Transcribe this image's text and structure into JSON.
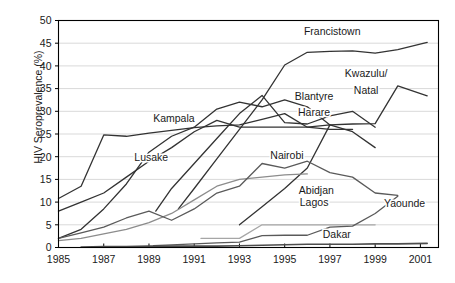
{
  "chart_data": {
    "type": "line",
    "title": "",
    "xlabel": "",
    "ylabel": "HIV Seroprevalence (%)",
    "xlim": [
      1985,
      2001.8
    ],
    "ylim": [
      0,
      50
    ],
    "ytick_step": 5,
    "xtick_step": 2,
    "grid": "horizontal",
    "legend": "inline-labels",
    "yticks": [
      "0",
      "5",
      "10",
      "15",
      "20",
      "25",
      "30",
      "35",
      "40",
      "45",
      "50"
    ],
    "xticks": [
      "1985",
      "1987",
      "1989",
      "1991",
      "1993",
      "1995",
      "1997",
      "1999",
      "2001"
    ],
    "series": [
      {
        "name": "Francistown",
        "color": "#333333",
        "width": 1.3,
        "label_x": 1997.1,
        "label_y": 47.6,
        "label_anchor": "middle",
        "x": [
          1990.3,
          1991.0,
          1992.0,
          1993.0,
          1994.0,
          1995.0,
          1996.0,
          1997.0,
          1998.0,
          1999.0,
          2000.0,
          2001.3
        ],
        "y": [
          8.5,
          13.0,
          19.5,
          26.0,
          32.5,
          40.2,
          43.0,
          43.2,
          43.3,
          42.8,
          43.6,
          45.2
        ]
      },
      {
        "name": "Kwazulu/Natal",
        "color": "#333333",
        "width": 1.3,
        "label_x": 1998.6,
        "label_y": 38.4,
        "label_anchor": "middle",
        "label_line2_y": 34.6,
        "x": [
          1993.0,
          1994.0,
          1995.0,
          1996.0,
          1997.0,
          1998.0,
          1999.0,
          2000.0,
          2001.3
        ],
        "y": [
          5.0,
          9.0,
          13.0,
          17.5,
          27.0,
          27.2,
          27.3,
          35.6,
          33.4
        ]
      },
      {
        "name": "Blantyre",
        "color": "#333333",
        "width": 1.3,
        "label_x": 1996.3,
        "label_y": 33.3,
        "label_anchor": "middle",
        "x": [
          1985.0,
          1986.0,
          1987.0,
          1988.0,
          1989.0,
          1990.0,
          1991.0,
          1992.0,
          1993.0,
          1994.0,
          1995.0,
          1996.0,
          1997.0
        ],
        "y": [
          2.0,
          4.0,
          8.5,
          14.0,
          21.0,
          24.5,
          26.5,
          30.5,
          32.0,
          31.0,
          32.5,
          31.0,
          27.0
        ]
      },
      {
        "name": "Harare",
        "color": "#333333",
        "width": 1.3,
        "label_x": 1996.3,
        "label_y": 29.7,
        "label_anchor": "middle",
        "x": [
          1989.3,
          1990.0,
          1991.0,
          1992.0,
          1993.0,
          1994.0,
          1995.0,
          1996.0,
          1997.0,
          1998.0,
          1999.0
        ],
        "y": [
          8.0,
          13.0,
          18.5,
          24.0,
          29.5,
          33.5,
          27.5,
          27.2,
          29.0,
          30.0,
          26.5
        ]
      },
      {
        "name": "Kampala",
        "color": "#333333",
        "width": 1.3,
        "label_x": 1990.1,
        "label_y": 28.5,
        "label_anchor": "middle",
        "x": [
          1985.0,
          1986.0,
          1987.0,
          1988.0,
          1989.0,
          1990.0,
          1991.0,
          1992.0,
          1993.0,
          1994.0,
          1995.0,
          1996.0,
          1997.0,
          1998.0
        ],
        "y": [
          10.8,
          13.5,
          24.8,
          24.5,
          25.2,
          25.8,
          26.4,
          26.8,
          27.0,
          28.2,
          29.5,
          26.5,
          26.0,
          26.0
        ]
      },
      {
        "name": "Lusake",
        "color": "#333333",
        "width": 1.3,
        "label_x": 1989.1,
        "label_y": 19.8,
        "label_anchor": "middle",
        "x": [
          1985.0,
          1986.0,
          1987.0,
          1988.0,
          1989.0,
          1990.0,
          1991.0,
          1992.0,
          1993.0,
          1994.0,
          1995.0,
          1996.0,
          1997.0,
          1998.0,
          1999.0
        ],
        "y": [
          8.0,
          10.0,
          12.0,
          15.5,
          19.0,
          22.0,
          25.5,
          28.0,
          26.5,
          26.5,
          26.5,
          26.5,
          27.0,
          25.5,
          22.0
        ]
      },
      {
        "name": "Nairobi",
        "color": "#8c8c8c",
        "width": 1.3,
        "label_x": 1995.1,
        "label_y": 20.4,
        "label_anchor": "middle",
        "x": [
          1985.0,
          1986.0,
          1987.0,
          1988.0,
          1989.0,
          1990.0,
          1991.0,
          1992.0,
          1993.0,
          1994.0,
          1995.0,
          1996.0
        ],
        "y": [
          1.5,
          2.0,
          3.0,
          4.0,
          5.5,
          7.5,
          10.5,
          13.5,
          15.0,
          15.5,
          16.0,
          16.2
        ]
      },
      {
        "name": "Abidjan",
        "color": "#5a5a5a",
        "width": 1.3,
        "label_x": 1996.4,
        "label_y": 12.6,
        "label_anchor": "middle",
        "x": [
          1985.0,
          1986.0,
          1987.0,
          1988.0,
          1989.0,
          1990.0,
          1991.0,
          1992.0,
          1993.0,
          1994.0,
          1995.0,
          1996.0,
          1997.0,
          1998.0,
          1999.0,
          2000.0
        ],
        "y": [
          2.0,
          3.2,
          4.5,
          6.5,
          8.0,
          6.0,
          8.5,
          12.0,
          13.5,
          18.5,
          17.5,
          19.0,
          16.5,
          15.5,
          12.0,
          11.5
        ]
      },
      {
        "name": "Lagos",
        "color": "#a6a6a6",
        "width": 1.3,
        "label_x": 1996.3,
        "label_y": 9.9,
        "label_anchor": "middle",
        "x": [
          1991.3,
          1992.0,
          1993.0,
          1994.0,
          1995.0,
          1996.0,
          1997.0,
          1998.0,
          1999.0
        ],
        "y": [
          2.0,
          2.0,
          2.0,
          5.0,
          5.0,
          5.0,
          5.0,
          5.0,
          5.0
        ]
      },
      {
        "name": "Yaounde",
        "color": "#5a5a5a",
        "width": 1.3,
        "label_x": 2000.3,
        "label_y": 9.7,
        "label_anchor": "middle",
        "x": [
          1989.2,
          1990.0,
          1991.0,
          1992.0,
          1993.0,
          1994.0,
          1995.0,
          1996.0,
          1997.0,
          1998.0,
          1999.0,
          2000.0
        ],
        "y": [
          0.4,
          0.6,
          0.8,
          1.0,
          1.2,
          2.6,
          2.7,
          2.7,
          4.5,
          4.7,
          7.5,
          11.3
        ]
      },
      {
        "name": "Dakar",
        "color": "#4d4d4d",
        "width": 1.6,
        "label_x": 1997.3,
        "label_y": 3.0,
        "label_anchor": "middle",
        "x": [
          1986.0,
          1987.0,
          1988.0,
          1989.0,
          1990.0,
          1991.0,
          1992.0,
          1993.0,
          1994.0,
          1995.0,
          1996.0,
          1997.0,
          1998.0,
          1999.0,
          2000.0,
          2001.3
        ],
        "y": [
          0.1,
          0.2,
          0.2,
          0.3,
          0.3,
          0.3,
          0.3,
          0.4,
          0.5,
          0.6,
          0.7,
          0.7,
          0.7,
          0.8,
          0.8,
          0.9
        ]
      }
    ]
  },
  "axes": {
    "y_axis_title": "HIV Seroprevalence (%)"
  },
  "style": {
    "gridline_color": "#d9d9d9",
    "axis_color": "#000000",
    "text_color": "#1a1a1a",
    "background": "#ffffff"
  }
}
